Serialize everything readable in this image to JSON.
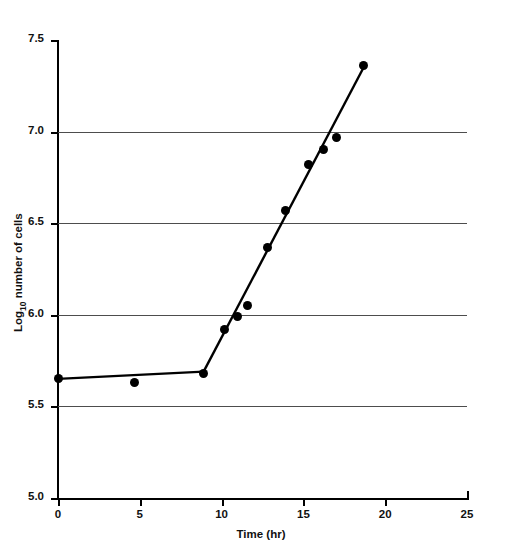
{
  "chart_data": {
    "type": "scatter",
    "xlabel": "Time (hr)",
    "ylabel": "Log10 number of cells",
    "xlim": [
      0,
      25
    ],
    "ylim": [
      5.0,
      7.5
    ],
    "xticks": [
      "0",
      "5",
      "10",
      "15",
      "20",
      "25"
    ],
    "xtick_values": [
      0,
      5,
      10,
      15,
      20,
      25
    ],
    "yticks": [
      "5.0",
      "5.5",
      "6.0",
      "6.5",
      "7.0",
      "7.5"
    ],
    "ytick_values": [
      5.0,
      5.5,
      6.0,
      6.5,
      7.0,
      7.5
    ],
    "grid": "horizontal",
    "legend": null,
    "points": [
      {
        "x": 0.0,
        "y": 5.65
      },
      {
        "x": 4.7,
        "y": 5.63
      },
      {
        "x": 8.9,
        "y": 5.68
      },
      {
        "x": 10.2,
        "y": 5.92
      },
      {
        "x": 11.0,
        "y": 5.99
      },
      {
        "x": 11.6,
        "y": 6.05
      },
      {
        "x": 12.8,
        "y": 6.37
      },
      {
        "x": 13.9,
        "y": 6.57
      },
      {
        "x": 15.3,
        "y": 6.82
      },
      {
        "x": 16.2,
        "y": 6.9
      },
      {
        "x": 17.0,
        "y": 6.97
      },
      {
        "x": 18.7,
        "y": 7.36
      }
    ],
    "fit_segments": [
      {
        "name": "lag-phase-line",
        "x1": 0.0,
        "y1": 5.65,
        "x2": 8.9,
        "y2": 5.69
      },
      {
        "name": "exponential-phase-line",
        "x1": 8.9,
        "y1": 5.69,
        "x2": 18.8,
        "y2": 7.37
      }
    ]
  }
}
